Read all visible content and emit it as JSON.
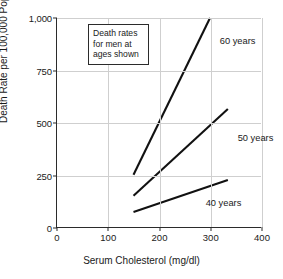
{
  "chart_data": {
    "type": "line",
    "title": "",
    "xlabel": "Serum Cholesterol (mg/dl)",
    "ylabel": "Death Rate per 100,000 Population",
    "xlim": [
      0,
      400
    ],
    "ylim": [
      0,
      1000
    ],
    "xticks": [
      "0",
      "100",
      "200",
      "300",
      "400"
    ],
    "xtick_values": [
      0,
      100,
      200,
      300,
      400
    ],
    "yticks": [
      "0",
      "250",
      "500",
      "750",
      "1,000"
    ],
    "ytick_values": [
      0,
      250,
      500,
      750,
      1000
    ],
    "grid": true,
    "legend_position": "inline-labels",
    "annotation": {
      "line1": "Death rates",
      "line2": "for men at",
      "line3": "ages shown"
    },
    "series": [
      {
        "name": "60 years",
        "label": "60 years",
        "x": [
          150,
          300
        ],
        "values": [
          250,
          1000
        ]
      },
      {
        "name": "50 years",
        "label": "50 years",
        "x": [
          150,
          335
        ],
        "values": [
          150,
          565
        ]
      },
      {
        "name": "40 years",
        "label": "40 years",
        "x": [
          150,
          335
        ],
        "values": [
          72,
          225
        ]
      }
    ],
    "colors": {
      "line": "#111111",
      "grid": "#cfcfcf",
      "axis": "#2b2b2b",
      "background": "#ffffff",
      "text": "#1a1a1a"
    }
  }
}
